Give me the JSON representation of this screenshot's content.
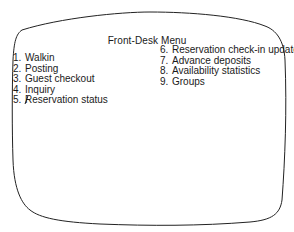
{
  "menu": {
    "title": "Front-Desk Menu",
    "left_items": [
      {
        "number": "1.",
        "label": "Walkin"
      },
      {
        "number": "2.",
        "label": "Posting"
      },
      {
        "number": "3.",
        "label": "Guest checkout"
      },
      {
        "number": "4.",
        "label": "Inquiry"
      },
      {
        "number": "5.",
        "label": "Reservation status"
      }
    ],
    "right_items": [
      {
        "number": "6.",
        "label": "Reservation check-in update"
      },
      {
        "number": "7.",
        "label": "Advance deposits"
      },
      {
        "number": "8.",
        "label": "Availability statistics"
      },
      {
        "number": "9.",
        "label": "Groups"
      }
    ]
  },
  "colors": {
    "text": "#1a1a1a",
    "background": "#ffffff",
    "outline": "#222222"
  }
}
